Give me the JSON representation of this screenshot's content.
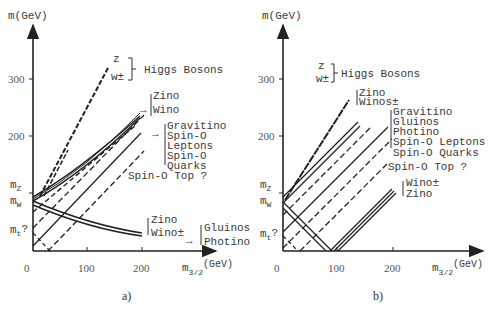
{
  "figure": {
    "panels": [
      {
        "id": "a",
        "caption": "a)",
        "y_axis_label": "m(GeV)",
        "x_axis_label_main": "m",
        "x_axis_label_sub": "3/2",
        "x_axis_label_unit": "(GeV)",
        "x_ticks": [
          "0",
          "100",
          "200"
        ],
        "y_ticks": [
          "300",
          "200"
        ],
        "y_markers": {
          "mZ": "m",
          "mZ_sub": "Z",
          "mW": "m",
          "mW_sub": "W",
          "mt": "m",
          "mt_sub": "t",
          "mt_q": "?"
        },
        "labels": {
          "higgs_z": "z",
          "higgs_w": "w±",
          "higgs": "Higgs Bosons",
          "zino_wino_upper_1": "Zino",
          "zino_wino_upper_2": "Wino",
          "group_1": "Gravitino",
          "group_2": "Spin-O",
          "group_3": "Leptons",
          "group_4": "Spin-O",
          "group_5": "Quarks",
          "top": "Spin-O Top ?",
          "zino_wino_lower_1": "Zino",
          "zino_wino_lower_2": "Wino±",
          "gluino_1": "Gluinos",
          "gluino_2": "Photino"
        }
      },
      {
        "id": "b",
        "caption": "b)",
        "y_axis_label": "m(GeV)",
        "x_axis_label_main": "m",
        "x_axis_label_sub": "3/2",
        "x_axis_label_unit": "(GeV)",
        "x_ticks": [
          "0",
          "100",
          "200"
        ],
        "y_ticks": [
          "300",
          "200"
        ],
        "y_markers": {
          "mZ": "m",
          "mZ_sub": "Z",
          "mW": "m",
          "mW_sub": "W",
          "mt": "m",
          "mt_sub": "t",
          "mt_q": "?"
        },
        "labels": {
          "higgs_z": "z",
          "higgs_w": "w±",
          "higgs": "Higgs Bosons",
          "zino_winos_1": "Zino",
          "zino_winos_2": "Winos±",
          "group_1": "Gravitino",
          "group_2": "Gluinos",
          "group_3": "Photino",
          "group_4": "Spin-O Leptons",
          "group_5": "Spin-O Quarks",
          "top": "Spin-O Top ?",
          "wino_zino_1": "Wino±",
          "wino_zino_2": "Zino"
        }
      }
    ]
  }
}
